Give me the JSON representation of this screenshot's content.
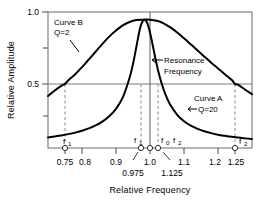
{
  "chart_data": {
    "type": "line",
    "title": "",
    "xlabel": "Relative Frequency",
    "ylabel": "Relative Amplitude",
    "xlim": [
      0.7,
      1.3
    ],
    "ylim": [
      0.0,
      1.06
    ],
    "grid": false,
    "legend_position": "inline-annotations",
    "x_ticks": [
      0.75,
      0.8,
      0.9,
      1.0,
      1.1,
      1.2,
      1.25
    ],
    "x_tick_labels": [
      "0.75",
      "0.8",
      "0.9",
      "1.0",
      "1.1",
      "1.2",
      "1.25"
    ],
    "y_ticks": [
      0.5,
      1.0
    ],
    "y_tick_labels": [
      "0.5",
      "1.0"
    ],
    "y_minor_ticks": [
      0.25,
      0.75
    ],
    "half_power_level": 0.5,
    "resonance_frequency": 1.0,
    "series": [
      {
        "name": "Curve A",
        "q": 20,
        "label": "Curve A",
        "q_label": "Q=20",
        "f1": 0.975,
        "f2": 1.125,
        "x": [
          0.7,
          0.72,
          0.74,
          0.76,
          0.78,
          0.8,
          0.82,
          0.84,
          0.86,
          0.88,
          0.9,
          0.92,
          0.94,
          0.95,
          0.96,
          0.965,
          0.97,
          0.975,
          0.98,
          0.985,
          0.99,
          0.995,
          1.0,
          1.005,
          1.01,
          1.015,
          1.02,
          1.025,
          1.03,
          1.04,
          1.05,
          1.06,
          1.08,
          1.1,
          1.12,
          1.14,
          1.16,
          1.18,
          1.2,
          1.22,
          1.24,
          1.26,
          1.28,
          1.3
        ],
        "y": [
          0.082,
          0.089,
          0.098,
          0.108,
          0.12,
          0.135,
          0.153,
          0.176,
          0.206,
          0.247,
          0.305,
          0.395,
          0.548,
          0.655,
          0.79,
          0.86,
          0.925,
          0.97,
          0.995,
          1.0,
          0.985,
          0.95,
          0.9,
          0.84,
          0.775,
          0.71,
          0.648,
          0.592,
          0.542,
          0.456,
          0.388,
          0.335,
          0.258,
          0.208,
          0.174,
          0.149,
          0.13,
          0.116,
          0.104,
          0.095,
          0.087,
          0.081,
          0.075,
          0.07
        ]
      },
      {
        "name": "Curve B",
        "q": 2,
        "label": "Curve B",
        "q_label": "Q=2",
        "f1": 0.75,
        "f2": 1.25,
        "x": [
          0.7,
          0.72,
          0.74,
          0.75,
          0.76,
          0.78,
          0.8,
          0.82,
          0.84,
          0.86,
          0.88,
          0.9,
          0.92,
          0.94,
          0.96,
          0.98,
          1.0,
          1.02,
          1.04,
          1.06,
          1.08,
          1.1,
          1.12,
          1.14,
          1.16,
          1.18,
          1.2,
          1.22,
          1.24,
          1.25,
          1.26,
          1.28,
          1.3
        ],
        "y": [
          0.405,
          0.448,
          0.486,
          0.5,
          0.528,
          0.575,
          0.63,
          0.69,
          0.75,
          0.812,
          0.868,
          0.915,
          0.955,
          0.982,
          0.997,
          1.0,
          1.0,
          0.992,
          0.972,
          0.94,
          0.9,
          0.855,
          0.808,
          0.76,
          0.712,
          0.665,
          0.62,
          0.575,
          0.532,
          0.5,
          0.492,
          0.454,
          0.42
        ]
      }
    ],
    "markers": [
      {
        "label": "f",
        "sub": "1",
        "x": 0.75,
        "belongs_to": "Curve B"
      },
      {
        "label": "f",
        "sub": "1",
        "x": 0.975,
        "belongs_to": "Curve A"
      },
      {
        "label": "f",
        "sub": "0",
        "x": 1.0,
        "belongs_to": "both"
      },
      {
        "label": "f",
        "sub": "2",
        "x": 1.125,
        "belongs_to": "Curve A"
      },
      {
        "label": "f",
        "sub": "2",
        "x": 1.25,
        "belongs_to": "Curve B"
      }
    ],
    "annotations": [
      {
        "text": "Resonance Frequency",
        "x": 1.0,
        "y": 0.72,
        "arrow": "left"
      },
      {
        "text": "0.975",
        "x": 0.975,
        "y": -0.18,
        "arrow": "leader"
      },
      {
        "text": "1.125",
        "x": 1.125,
        "y": -0.18,
        "arrow": "leader"
      }
    ]
  },
  "labels": {
    "ylabel": "Relative Amplitude",
    "xlabel": "Relative Frequency",
    "y_tick_1": "1.0",
    "y_tick_0_5": "0.5",
    "x_tick_075": "0.75",
    "x_tick_08": "0.8",
    "x_tick_09": "0.9",
    "x_tick_10": "1.0",
    "x_tick_11": "1.1",
    "x_tick_12": "1.2",
    "x_tick_125": "1.25",
    "sub_0975": "0.975",
    "sub_1125": "1.125",
    "curve_b_name": "Curve B",
    "curve_b_q": "Q=2",
    "curve_a_name": "Curve A",
    "curve_a_q": "Q=20",
    "resonance_line1": "Resonance",
    "resonance_line2": "Frequency",
    "f": "f",
    "sub_1": "1",
    "sub_0": "0",
    "sub_2": "2"
  },
  "colors": {
    "curve": "#000000",
    "frame": "#6b6b6b",
    "dashed": "#8a8a8a",
    "half_power_line": "#7a7a7a",
    "background": "#ffffff"
  }
}
